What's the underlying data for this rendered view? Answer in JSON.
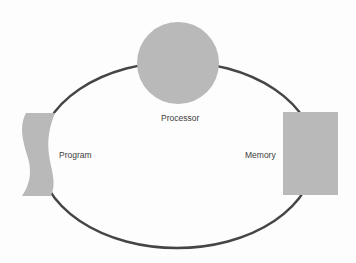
{
  "diagram": {
    "type": "cycle",
    "colors": {
      "background": "#fdfdfd",
      "shape_fill": "#b9b9b9",
      "connector_stroke": "#454545",
      "label_text": "#3c3c3c"
    },
    "connector": {
      "shape": "ellipse",
      "cx": 177,
      "cy": 155,
      "rx": 138,
      "ry": 93
    },
    "nodes": [
      {
        "id": "processor",
        "label": "Processor",
        "shape": "circle",
        "cx": 178,
        "cy": 63,
        "r": 41
      },
      {
        "id": "program",
        "label": "Program",
        "shape": "wavy-document"
      },
      {
        "id": "memory",
        "label": "Memory",
        "shape": "rectangle",
        "x": 283,
        "y": 112,
        "width": 55,
        "height": 83
      }
    ],
    "labels": {
      "processor": "Processor",
      "program": "Program",
      "memory": "Memory"
    }
  }
}
